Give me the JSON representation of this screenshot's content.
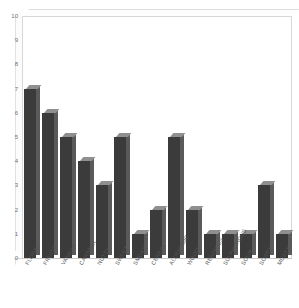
{
  "chart_data": {
    "type": "bar",
    "title": "",
    "subtitle": "",
    "xlabel": "",
    "ylabel": "",
    "ylim": [
      0,
      10
    ],
    "ytick_step": 1,
    "grid": false,
    "legend": "none",
    "style": "3d-bars",
    "bar_color": "#3b3b3b",
    "bar_top_color": "#8f8f8f",
    "bar_side_color": "#5a5a5a",
    "background": "#ffffff",
    "frame_color": "#d8d8d8",
    "axis_text_color": "#6f6f6f",
    "label_rotation_deg": -60,
    "categories": [
      "FLORAL",
      "FRUITY",
      "VANILLA",
      "CARAMEL",
      "NUTTY",
      "SWEET",
      "SMOKY",
      "CEREAL",
      "ALDEHYDIC",
      "WOODY",
      "RESINOUS",
      "SULPHUROUS",
      "SOUR",
      "SOAPY",
      "MUSTY"
    ],
    "values": [
      7,
      6,
      5,
      4,
      3,
      5,
      1,
      2,
      5,
      2,
      1,
      1,
      1,
      3,
      1
    ],
    "yticks": [
      "0",
      "1",
      "2",
      "3",
      "4",
      "5",
      "6",
      "7",
      "8",
      "9",
      "10"
    ]
  }
}
